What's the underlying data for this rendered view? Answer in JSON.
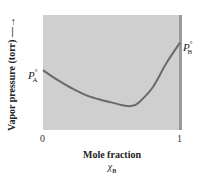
{
  "chart_data": {
    "type": "line",
    "title": "",
    "xlabel": "Mole fraction",
    "xlabel_sub": "χ",
    "xlabel_sub_subscript": "B",
    "ylabel": "Vapor pressure (torr) —→",
    "x_ticks": [
      "0",
      "1"
    ],
    "xlim": [
      0,
      1
    ],
    "grid": false,
    "legend": null,
    "background_fill": "#cfcfcf",
    "line_color": "#6a6a6a",
    "annotations": [
      {
        "text": "P",
        "sup": "°",
        "sub": "A",
        "position": "left edge, x=0"
      },
      {
        "text": "P",
        "sup": "°",
        "sub": "B",
        "position": "right edge, x=1"
      }
    ],
    "series": [
      {
        "name": "Vapor pressure",
        "x": [
          0.0,
          0.1,
          0.2,
          0.3,
          0.4,
          0.5,
          0.6,
          0.65,
          0.7,
          0.8,
          0.9,
          1.0
        ],
        "y_relative": [
          0.52,
          0.44,
          0.37,
          0.31,
          0.27,
          0.24,
          0.21,
          0.21,
          0.24,
          0.37,
          0.58,
          0.76
        ]
      }
    ]
  },
  "labels": {
    "y_axis": "Vapor pressure (torr) —→",
    "x_axis": "Mole fraction",
    "x_axis_symbol": "χ",
    "x_axis_symbol_sub": "B",
    "tick_0": "0",
    "tick_1": "1",
    "pa_main": "P",
    "pa_sup": "°",
    "pa_sub": "A",
    "pb_main": "P",
    "pb_sup": "°",
    "pb_sub": "B"
  }
}
